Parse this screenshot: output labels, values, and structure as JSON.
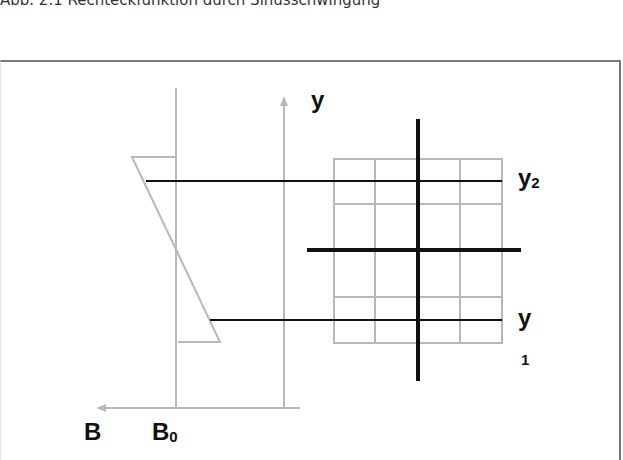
{
  "caption": "Abb. 2.1 Rechteckfunktion durch Sinusschwingung",
  "labels": {
    "y_axis": "y",
    "y2_main": "y",
    "y2_sub": "2",
    "y1_main": "y",
    "y1_sub": "1",
    "b_axis": "B",
    "b0_main": "B",
    "b0_sub": "0"
  },
  "colors": {
    "gray_line": "#b8b8b8",
    "black_line": "#111111",
    "frame": "#7a7a7a"
  }
}
